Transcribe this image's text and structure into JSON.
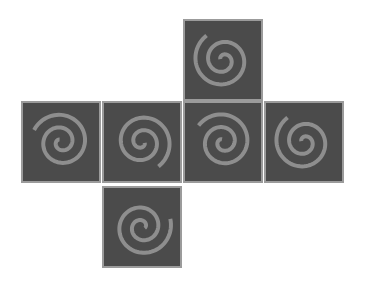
{
  "diagram": {
    "title": "",
    "type": "cube-net",
    "colors": {
      "face": "#4b4b4b",
      "border": "#9b9b9b",
      "spiral": "#8e8e8e",
      "background": "#ffffff"
    },
    "faces": [
      {
        "id": "top",
        "x": 183,
        "y": 19,
        "rotate": 200,
        "mirror": false
      },
      {
        "id": "row-1",
        "x": 21,
        "y": 101,
        "rotate": -60,
        "mirror": true
      },
      {
        "id": "row-2",
        "x": 102,
        "y": 101,
        "rotate": 20,
        "mirror": false
      },
      {
        "id": "row-3",
        "x": 183,
        "y": 101,
        "rotate": -70,
        "mirror": true
      },
      {
        "id": "row-4",
        "x": 264,
        "y": 101,
        "rotate": 200,
        "mirror": false
      },
      {
        "id": "bottom",
        "x": 102,
        "y": 186,
        "rotate": 160,
        "mirror": true
      }
    ],
    "symbol": "spiral-icon"
  }
}
